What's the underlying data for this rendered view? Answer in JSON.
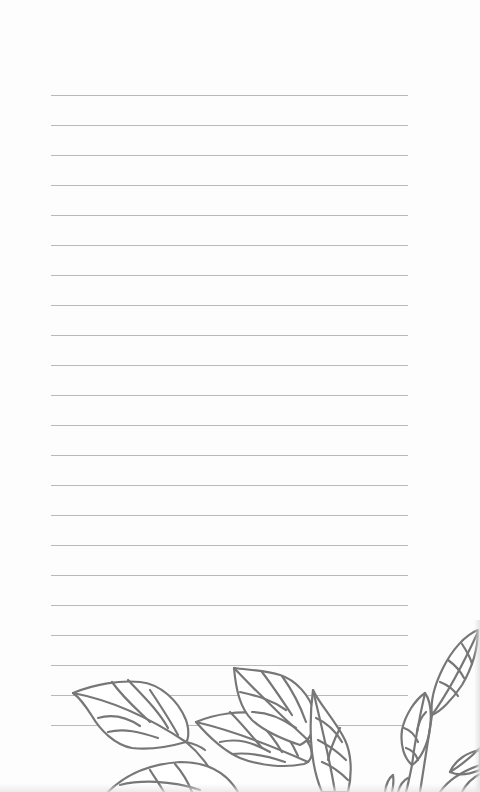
{
  "page": {
    "type": "lined-notepaper",
    "background_color": "#fdfdfd",
    "rule_color": "#b9b9b9",
    "illustration_color": "#777777"
  },
  "rules": {
    "count": 22,
    "start_y": 95,
    "spacing": 30,
    "left_x": 51,
    "right_x": 408
  },
  "illustration": {
    "subject": "leaf-branch-line-art",
    "position": "bottom"
  }
}
